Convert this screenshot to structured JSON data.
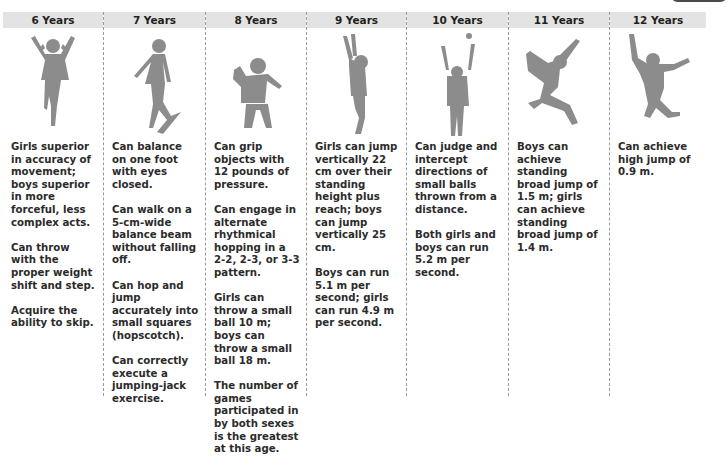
{
  "columns": [
    {
      "age": "6 Years",
      "figure": "girl-jumping-rope-silhouette",
      "items": [
        "Girls superior in accuracy of movement; boys superior in more forceful, less complex acts.",
        "Can throw with the proper weight shift and step.",
        "Acquire the ability to skip."
      ]
    },
    {
      "age": "7 Years",
      "figure": "girl-walking-balance-beam-silhouette",
      "items": [
        "Can balance on one foot with eyes closed.",
        "Can walk on a 5-cm-wide balance beam without falling off.",
        "Can hop and jump accurately into small squares (hopscotch).",
        "Can correctly execute a jumping-jack exercise."
      ]
    },
    {
      "age": "8 Years",
      "figure": "boy-throwing-silhouette",
      "items": [
        "Can grip objects with 12 pounds of pressure.",
        "Can engage in alternate rhythmical hopping in a 2-2, 2-3, or 3-3 pattern.",
        "Girls can throw a small ball 10 m; boys can throw a small ball 18 m.",
        "The number of games participated in by both sexes is the greatest at this age."
      ]
    },
    {
      "age": "9 Years",
      "figure": "boy-jumping-vertically-silhouette",
      "items": [
        "Girls can jump vertically 22 cm over their standing height plus reach; boys can jump vertically 25 cm.",
        "Boys can run 5.1 m per second; girls can run 4.9 m per second."
      ]
    },
    {
      "age": "10 Years",
      "figure": "girl-catching-ball-silhouette",
      "items": [
        "Can judge and intercept directions of small balls thrown from a distance.",
        "Both girls and boys can run 5.2 m per second."
      ]
    },
    {
      "age": "11 Years",
      "figure": "girl-broad-jump-silhouette",
      "items": [
        "Boys can achieve standing broad jump of 1.5 m; girls can achieve standing broad jump of 1.4 m."
      ]
    },
    {
      "age": "12 Years",
      "figure": "boy-high-jump-silhouette",
      "items": [
        "Can achieve high jump of 0.9 m."
      ]
    }
  ],
  "colors": {
    "header_bg": "#e3e3e3",
    "silhouette": "#8c8c8c",
    "separator": "#9a9a9a"
  }
}
